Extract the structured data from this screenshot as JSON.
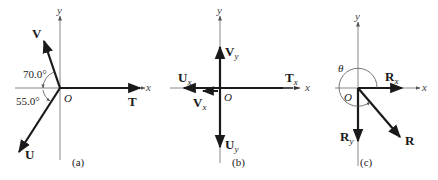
{
  "panels": [
    {
      "id": "a",
      "caption": "(a)",
      "origin_label": "O",
      "axis_labels": {
        "x": "x",
        "y": "y"
      },
      "vectors": [
        {
          "name": "T",
          "label": "T"
        },
        {
          "name": "V",
          "label": "V"
        },
        {
          "name": "U",
          "label": "U"
        }
      ],
      "angles": [
        {
          "label": "70.0°",
          "between": "V and negative x-axis"
        },
        {
          "label": "55.0°",
          "between": "U and negative x-axis"
        }
      ]
    },
    {
      "id": "b",
      "caption": "(b)",
      "origin_label": "O",
      "axis_labels": {
        "x": "x",
        "y": "y"
      },
      "vectors": [
        {
          "name": "V_y",
          "main": "V",
          "sub": "y"
        },
        {
          "name": "U_x",
          "main": "U",
          "sub": "x"
        },
        {
          "name": "T_x",
          "main": "T",
          "sub": "x"
        },
        {
          "name": "V_x",
          "main": "V",
          "sub": "x"
        },
        {
          "name": "U_y",
          "main": "U",
          "sub": "y"
        }
      ]
    },
    {
      "id": "c",
      "caption": "(c)",
      "origin_label": "O",
      "axis_labels": {
        "x": "x",
        "y": "y"
      },
      "angle_label": "θ",
      "vectors": [
        {
          "name": "R_x",
          "main": "R",
          "sub": "x"
        },
        {
          "name": "R_y",
          "main": "R",
          "sub": "y"
        },
        {
          "name": "R",
          "label": "R"
        }
      ]
    }
  ]
}
